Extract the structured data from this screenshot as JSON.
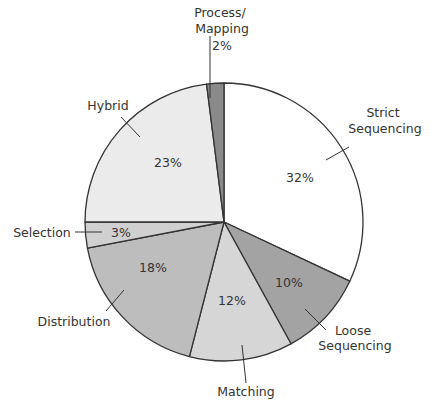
{
  "chart_data": {
    "type": "pie",
    "title": "",
    "start_angle_deg": 0,
    "direction": "clockwise",
    "slices": [
      {
        "label": "Strict Sequencing",
        "label_lines": [
          "Strict",
          "Sequencing"
        ],
        "value": 32,
        "pct_label": "32%",
        "color": "#ffffff"
      },
      {
        "label": "Loose Sequencing",
        "label_lines": [
          "Loose",
          "Sequencing"
        ],
        "value": 10,
        "pct_label": "10%",
        "color": "#a3a3a3"
      },
      {
        "label": "Matching",
        "label_lines": [
          "Matching"
        ],
        "value": 12,
        "pct_label": "12%",
        "color": "#d6d6d6"
      },
      {
        "label": "Distribution",
        "label_lines": [
          "Distribution"
        ],
        "value": 18,
        "pct_label": "18%",
        "color": "#bdbdbd"
      },
      {
        "label": "Selection",
        "label_lines": [
          "Selection"
        ],
        "value": 3,
        "pct_label": "3%",
        "color": "#d0d0d0"
      },
      {
        "label": "Hybrid",
        "label_lines": [
          "Hybrid"
        ],
        "value": 23,
        "pct_label": "23%",
        "color": "#ebebeb"
      },
      {
        "label": "Process/Mapping",
        "label_lines": [
          "Process/",
          "Mapping"
        ],
        "value": 2,
        "pct_label": "2%",
        "color": "#8a8a8a"
      }
    ],
    "categories": [
      "Strict Sequencing",
      "Loose Sequencing",
      "Matching",
      "Distribution",
      "Selection",
      "Hybrid",
      "Process/Mapping"
    ],
    "values": [
      32,
      10,
      12,
      18,
      3,
      23,
      2
    ],
    "legend": "none (callout labels)"
  }
}
